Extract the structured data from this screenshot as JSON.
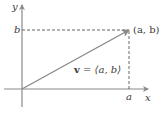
{
  "diagram": {
    "axes": {
      "x_label": "x",
      "y_label": "y",
      "color": "#8a8a8a"
    },
    "point": {
      "label": "(a, b)",
      "x_tick_label": "a",
      "y_tick_label": "b"
    },
    "vector": {
      "name": "v",
      "equals": " = ",
      "components": "⟨a, b⟩",
      "color": "#8a8a8a"
    },
    "guides": {
      "style": "dashed",
      "color": "#555555"
    }
  }
}
